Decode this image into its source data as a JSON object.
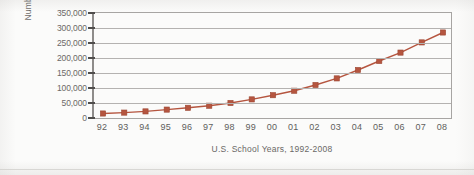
{
  "figure": {
    "background_color": "#fbfbfa",
    "series_color": "#b5553f",
    "grid_color": "#b4b2b0",
    "frame_color": "#a7a5a3"
  },
  "chart_data": {
    "type": "line",
    "title": "",
    "subtitle": "",
    "xlabel": "U.S. School Years, 1992-2008",
    "ylabel": "Number of Cases",
    "categories": [
      "92",
      "93",
      "94",
      "95",
      "96",
      "97",
      "98",
      "99",
      "00",
      "01",
      "02",
      "03",
      "04",
      "05",
      "06",
      "07",
      "08"
    ],
    "values": [
      15000,
      18000,
      22000,
      28000,
      34000,
      41000,
      50000,
      62000,
      76000,
      91000,
      110000,
      132000,
      160000,
      190000,
      218000,
      252000,
      285000
    ],
    "ylim": [
      0,
      350000
    ],
    "ytick_labels": [
      "350,000",
      "300,000",
      "250,000",
      "200,000",
      "150,000",
      "100,000",
      "50,000",
      "0"
    ],
    "ytick_values": [
      350000,
      300000,
      250000,
      200000,
      150000,
      100000,
      50000,
      0
    ],
    "grid": true,
    "grid_axis": "y",
    "legend": false,
    "legend_position": "none",
    "marker": "square",
    "marker_color": "#b5553f",
    "line_color": "#b5553f",
    "series": [
      {
        "name": "Number of Cases",
        "values": [
          15000,
          18000,
          22000,
          28000,
          34000,
          41000,
          50000,
          62000,
          76000,
          91000,
          110000,
          132000,
          160000,
          190000,
          218000,
          252000,
          285000
        ]
      }
    ]
  }
}
